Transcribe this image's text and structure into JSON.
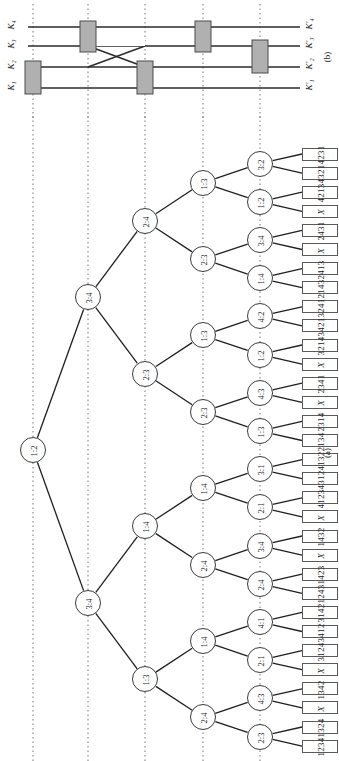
{
  "figure": {
    "panel_a_label": "(a)",
    "panel_b_label": "(b)"
  },
  "network": {
    "inputs": [
      "K₁",
      "K₂",
      "K₃",
      "K₄"
    ],
    "outputs": [
      "K′₁",
      "K′₂",
      "K′₃",
      "K′₄"
    ],
    "comparator_count": 5
  },
  "tree": {
    "root": "1:2",
    "depth1": [
      "3:4",
      "3:4"
    ],
    "depth2": [
      "2:4",
      "2:3",
      "1:4",
      "1:3"
    ],
    "depth3": [
      "1:3",
      "2:3",
      "1:3",
      "2:3",
      "1:4",
      "2:4",
      "1:4",
      "2:4"
    ],
    "depth4": [
      "3:2",
      "1:2",
      "3:4",
      "1:4",
      "4:2",
      "1:2",
      "4:3",
      "1:3",
      "3:1",
      "2:1",
      "3:4",
      "2:4",
      "4:1",
      "2:1",
      "4:3",
      "2:3"
    ],
    "leaves": [
      "4231",
      "4321",
      "4213",
      "X",
      "2431",
      "X",
      "2413",
      "2143",
      "3241",
      "3421",
      "3214",
      "X",
      "2341",
      "X",
      "2314",
      "2134",
      "4132",
      "4312",
      "4123",
      "X",
      "1432",
      "X",
      "1423",
      "1243",
      "3142",
      "3412",
      "3124",
      "X",
      "1342",
      "X",
      "1324",
      "1234"
    ]
  }
}
